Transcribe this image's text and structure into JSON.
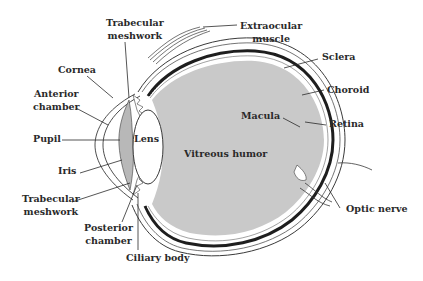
{
  "diagram": {
    "colors": {
      "background": "#ffffff",
      "vitreous_fill": "#c9c9c9",
      "line": "#3a3a3a",
      "choroid": "#1e1e1e",
      "text": "#2a2a2a"
    },
    "labels": {
      "trabecular_top": [
        "Trabecular",
        "meshwork"
      ],
      "extraocular": [
        "Extraocular",
        "muscle"
      ],
      "sclera": "Sclera",
      "cornea": "Cornea",
      "choroid": "Choroid",
      "anterior_chamber": [
        "Anterior",
        "chamber"
      ],
      "macula": "Macula",
      "retina": "Retina",
      "pupil": "Pupil",
      "lens": "Lens",
      "vitreous": "Vitreous humor",
      "iris": "Iris",
      "trabecular_bottom": [
        "Trabecular",
        "meshwork"
      ],
      "posterior_chamber": [
        "Posterior",
        "chamber"
      ],
      "optic_nerve": "Optic nerve",
      "ciliary_body": "Ciliary body"
    }
  }
}
